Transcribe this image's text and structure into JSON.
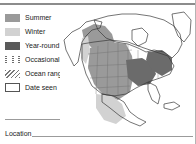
{
  "legend": {
    "items": [
      {
        "symbol": "summer-swatch",
        "label": "Summer",
        "color": "#9a9a9a"
      },
      {
        "symbol": "winter-swatch",
        "label": "Winter",
        "color": "#d2d2d2"
      },
      {
        "symbol": "year-round-swatch",
        "label": "Year-round",
        "color": "#5a5a5a"
      },
      {
        "symbol": "occasional-dotted-swatch",
        "label": "Occasional",
        "color": "#6e6e6e"
      },
      {
        "symbol": "ocean-range-hatch-swatch",
        "label": "Ocean range",
        "color": "#777777"
      },
      {
        "symbol": "date-seen-empty-box",
        "label": "Date seen",
        "color": "#555555"
      }
    ]
  },
  "footer": {
    "location_label": "Location",
    "location_value": ""
  },
  "map": {
    "region": "North America",
    "rule_color": "#8c8c8c",
    "coastline_color": "#3a3a3a",
    "summer_fill": "#9a9a9a",
    "winter_fill": "#d2d2d2",
    "year_round_fill": "#6b6b6b"
  }
}
